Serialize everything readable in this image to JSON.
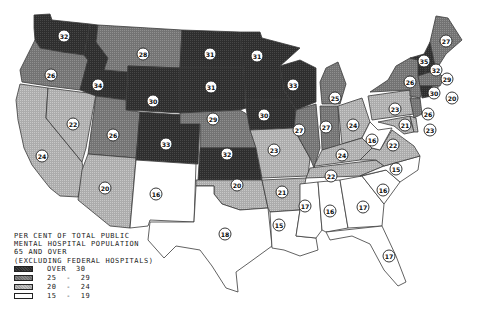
{
  "legend": {
    "title_lines": [
      "PER CENT OF TOTAL PUBLIC",
      "MENTAL HOSPITAL POPULATION",
      "65 AND OVER",
      "(EXCLUDING FEDERAL HOSPITALS)"
    ],
    "categories": [
      {
        "key": "over30",
        "label": "OVER  30",
        "color": "#333333"
      },
      {
        "key": "25-29",
        "label": "25  -  29",
        "color": "#7a7a7a"
      },
      {
        "key": "20-24",
        "label": "20  -  24",
        "color": "#b5b5b5"
      },
      {
        "key": "15-19",
        "label": "15  -  19",
        "color": "#ffffff"
      }
    ]
  },
  "states": [
    {
      "name": "Washington",
      "value": "32",
      "category": "over30"
    },
    {
      "name": "Oregon",
      "value": "26",
      "category": "25-29"
    },
    {
      "name": "California",
      "value": "24",
      "category": "20-24"
    },
    {
      "name": "Nevada",
      "value": "22",
      "category": "20-24"
    },
    {
      "name": "Idaho",
      "value": "34",
      "category": "over30"
    },
    {
      "name": "Montana",
      "value": "28",
      "category": "25-29"
    },
    {
      "name": "Wyoming",
      "value": "30",
      "category": "over30"
    },
    {
      "name": "Utah",
      "value": "26",
      "category": "25-29"
    },
    {
      "name": "Arizona",
      "value": "20",
      "category": "20-24"
    },
    {
      "name": "Colorado",
      "value": "33",
      "category": "over30"
    },
    {
      "name": "New Mexico",
      "value": "16",
      "category": "15-19"
    },
    {
      "name": "North Dakota",
      "value": "31",
      "category": "over30"
    },
    {
      "name": "South Dakota",
      "value": "31",
      "category": "over30"
    },
    {
      "name": "Nebraska",
      "value": "29",
      "category": "25-29"
    },
    {
      "name": "Kansas",
      "value": "32",
      "category": "over30"
    },
    {
      "name": "Oklahoma",
      "value": "20",
      "category": "20-24"
    },
    {
      "name": "Texas",
      "value": "18",
      "category": "15-19"
    },
    {
      "name": "Minnesota",
      "value": "31",
      "category": "over30"
    },
    {
      "name": "Iowa",
      "value": "30",
      "category": "over30"
    },
    {
      "name": "Missouri",
      "value": "23",
      "category": "20-24"
    },
    {
      "name": "Arkansas",
      "value": "21",
      "category": "20-24"
    },
    {
      "name": "Louisiana",
      "value": "15",
      "category": "15-19"
    },
    {
      "name": "Wisconsin",
      "value": "33",
      "category": "over30"
    },
    {
      "name": "Illinois",
      "value": "27",
      "category": "25-29"
    },
    {
      "name": "Michigan",
      "value": "25",
      "category": "25-29"
    },
    {
      "name": "Indiana",
      "value": "27",
      "category": "25-29"
    },
    {
      "name": "Ohio",
      "value": "24",
      "category": "20-24"
    },
    {
      "name": "Kentucky",
      "value": "24",
      "category": "20-24"
    },
    {
      "name": "Tennessee",
      "value": "22",
      "category": "20-24"
    },
    {
      "name": "Mississippi",
      "value": "17",
      "category": "15-19"
    },
    {
      "name": "Alabama",
      "value": "16",
      "category": "15-19"
    },
    {
      "name": "Georgia",
      "value": "17",
      "category": "15-19"
    },
    {
      "name": "Florida",
      "value": "17",
      "category": "15-19"
    },
    {
      "name": "South Carolina",
      "value": "16",
      "category": "15-19"
    },
    {
      "name": "North Carolina",
      "value": "15",
      "category": "15-19"
    },
    {
      "name": "Virginia",
      "value": "22",
      "category": "20-24"
    },
    {
      "name": "West Virginia",
      "value": "16",
      "category": "15-19"
    },
    {
      "name": "Maryland",
      "value": "21",
      "category": "20-24"
    },
    {
      "name": "Delaware",
      "value": "23",
      "category": "20-24"
    },
    {
      "name": "Pennsylvania",
      "value": "23",
      "category": "20-24"
    },
    {
      "name": "New Jersey",
      "value": "26",
      "category": "25-29"
    },
    {
      "name": "New York",
      "value": "26",
      "category": "25-29"
    },
    {
      "name": "Connecticut",
      "value": "30",
      "category": "over30"
    },
    {
      "name": "Rhode Island",
      "value": "20",
      "category": "20-24"
    },
    {
      "name": "Massachusetts",
      "value": "29",
      "category": "25-29"
    },
    {
      "name": "Vermont",
      "value": "35",
      "category": "over30"
    },
    {
      "name": "New Hampshire",
      "value": "32",
      "category": "over30"
    },
    {
      "name": "Maine",
      "value": "27",
      "category": "25-29"
    }
  ]
}
